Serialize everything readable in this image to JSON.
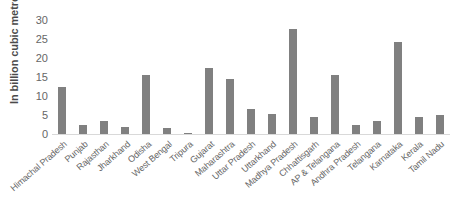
{
  "chart_data": {
    "type": "bar",
    "title": "",
    "xlabel": "",
    "ylabel": "In billion cubic metre",
    "ylim": [
      0,
      30
    ],
    "yticks": [
      0,
      5,
      10,
      15,
      20,
      25,
      30
    ],
    "grid": false,
    "legend": null,
    "orientation": "vertical",
    "bar_color": "#808080",
    "categories": [
      "Himachal Pradesh",
      "Punjab",
      "Rajasthan",
      "Jharkhand",
      "Odisha",
      "West Bengal",
      "Tripura",
      "Gujarat",
      "Maharashtra",
      "Uttar Pradesh",
      "Uttarkhand",
      "Madhya Pradesh",
      "Chhattisgarh",
      "AP & Telangana",
      "Andhra Pradesh",
      "Telangana",
      "Karnataka",
      "Kerala",
      "Tamil Nadu"
    ],
    "values": [
      12.3,
      2.3,
      3.4,
      1.9,
      15.5,
      1.6,
      0.3,
      17.5,
      14.4,
      6.7,
      5.2,
      27.7,
      4.4,
      15.6,
      2.5,
      3.5,
      24.2,
      4.6,
      4.9
    ]
  }
}
